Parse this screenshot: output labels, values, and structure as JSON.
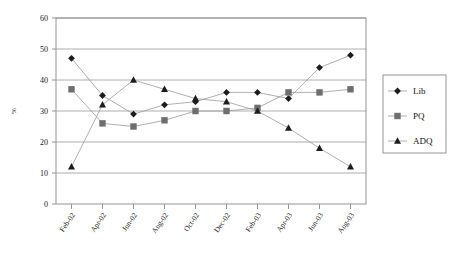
{
  "chart_data": {
    "type": "line",
    "title": "",
    "subtitle": "",
    "xlabel": "",
    "ylabel": "%",
    "ylim": [
      0,
      60
    ],
    "ytick_step": 10,
    "yticks": [
      0,
      10,
      20,
      30,
      40,
      50,
      60
    ],
    "ytick_labels": [
      "0",
      "10",
      "20",
      "30",
      "40",
      "50",
      "60"
    ],
    "grid": true,
    "grid_axis": "y",
    "legend_position": "right",
    "categories": [
      "Feb-02",
      "Apr-02",
      "Jun-02",
      "Aug-02",
      "Oct-02",
      "Dec-02",
      "Feb-03",
      "Apr-03",
      "Jun-03",
      "Aug-03"
    ],
    "x_tick_labels": [
      "Feb-02",
      "Apr-02",
      "Jun-02",
      "Aug-02",
      "Oct-02",
      "Dec-02",
      "Feb-03",
      "Apr-03",
      "Jun-03",
      "Aug-03"
    ],
    "x": [
      "Feb-02",
      "Jun-02",
      "Oct-02",
      "Nov-02",
      "Dec-02",
      "Jan-03",
      "Feb-03",
      "Apr-03",
      "Jun-03",
      "Aug-03"
    ],
    "series": [
      {
        "name": "Lib",
        "marker": "diamond",
        "color": "#1c1c1c",
        "values": [
          47,
          35,
          29,
          32,
          33,
          36,
          36,
          34,
          44,
          48
        ]
      },
      {
        "name": "PQ",
        "marker": "square",
        "color": "#6e6e6e",
        "values": [
          37,
          26,
          25,
          27,
          30,
          30,
          31,
          36,
          36,
          37
        ]
      },
      {
        "name": "ADQ",
        "marker": "triangle",
        "color": "#1c1c1c",
        "values": [
          12,
          32,
          40,
          37,
          34,
          33,
          30,
          24.5,
          18,
          12
        ]
      }
    ],
    "legend": [
      {
        "label": "Lib",
        "marker": "diamond",
        "color": "#1c1c1c"
      },
      {
        "label": "PQ",
        "marker": "square",
        "color": "#6e6e6e"
      },
      {
        "label": "ADQ",
        "marker": "triangle",
        "color": "#1c1c1c"
      }
    ],
    "colors": {
      "line": "#9b9b9b",
      "grid": "#9a9a9a",
      "axis": "#7a7a7a",
      "text": "#1a1a1a",
      "background": "#ffffff"
    }
  }
}
